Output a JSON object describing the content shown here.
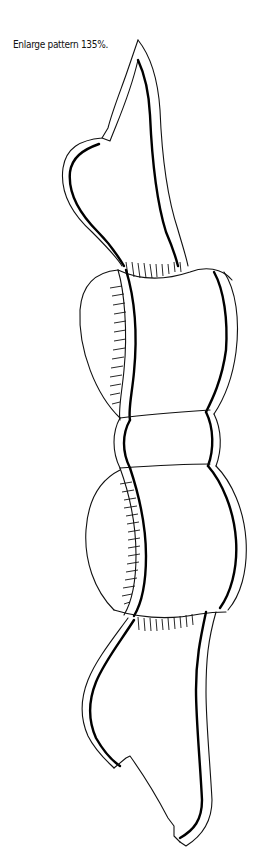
{
  "page": {
    "caption": "Enlarge pattern 135%."
  },
  "pattern": {
    "subject": "bow-with-ribbon-tails",
    "stroke_color": "#111111",
    "background": "#ffffff"
  }
}
